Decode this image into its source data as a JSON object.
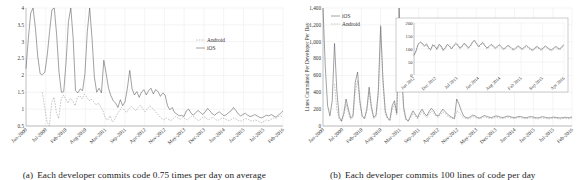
{
  "figure": {
    "panels": [
      {
        "id": "panel-a",
        "caption_label": "(a)",
        "caption_text": "Each developer commits code 0.75 times per day on average"
      },
      {
        "id": "panel-b",
        "caption_label": "(b)",
        "caption_text": "Each developer commits 100 lines of code per day"
      }
    ]
  },
  "colors": {
    "ios_line": "#555555",
    "android_line": "#8a8a8a",
    "grid": "#e2e2e2",
    "axis": "#8c8c8c",
    "text": "#2f2f2f",
    "background": "#ffffff"
  },
  "chart_data": [
    {
      "id": "commits-per-developer-per-day",
      "type": "line",
      "title": "",
      "xlabel": "",
      "ylabel": "",
      "ylim": [
        0.5,
        4
      ],
      "yticks": [
        "0.5",
        "1",
        "1.5",
        "2",
        "2.5",
        "3",
        "3.5",
        "4"
      ],
      "ytickvalues": [
        0.5,
        1,
        1.5,
        2,
        2.5,
        3,
        3.5,
        4
      ],
      "grid": true,
      "legend_position": "upper-right",
      "xtick_labels": [
        "Jan-2009",
        "Jul-2009",
        "Feb-2010",
        "Aug-2010",
        "Mar-2011",
        "Sep-2011",
        "Apr-2012",
        "Nov-2012",
        "May-2013",
        "Dec-2013",
        "Jun-2014",
        "Jan-2015",
        "Jul-2015",
        "Feb-2016"
      ],
      "series": [
        {
          "name": "Android",
          "style": "dashed",
          "values": [
            null,
            null,
            null,
            null,
            null,
            null,
            null,
            1.5,
            1.05,
            0.62,
            0.5,
            1.2,
            1.35,
            0.9,
            0.72,
            1.28,
            1.42,
            1.3,
            1.18,
            1.32,
            1.24,
            1.1,
            1.35,
            1.4,
            1.3,
            1.44,
            1.36,
            1.25,
            1.3,
            1.22,
            1.12,
            1.18,
            1.05,
            0.95,
            0.72,
            0.68,
            0.8,
            0.62,
            0.7,
            0.85,
            0.95,
            1.05,
            0.98,
            0.9,
            1.0,
            1.08,
            1.02,
            0.95,
            1.05,
            1.12,
            1.0,
            0.92,
            1.02,
            1.1,
            1.04,
            0.96,
            0.88,
            0.8,
            0.72,
            0.68,
            0.74,
            0.7,
            0.66,
            0.72,
            0.78,
            0.74,
            0.7,
            0.76,
            0.72,
            0.68,
            0.74,
            0.8,
            0.76,
            0.7,
            0.66,
            0.72,
            0.78,
            0.74,
            0.68,
            0.72,
            0.76,
            0.7,
            0.66,
            0.7,
            0.74,
            0.72,
            0.68,
            0.66,
            0.7,
            0.74,
            0.7,
            0.66,
            0.64,
            0.68,
            0.72,
            0.7,
            0.66,
            0.64,
            0.68,
            0.66,
            0.62,
            0.6,
            0.64,
            0.68,
            0.66,
            0.7,
            0.74,
            0.72,
            0.78,
            0.8,
            0.76
          ]
        },
        {
          "name": "iOS",
          "style": "solid",
          "values": [
            2.2,
            3.1,
            3.85,
            4.0,
            3.4,
            2.55,
            2.05,
            2.02,
            2.1,
            2.6,
            3.3,
            3.95,
            4.0,
            3.2,
            2.1,
            1.5,
            1.52,
            2.4,
            3.6,
            4.0,
            3.1,
            1.55,
            1.48,
            1.6,
            1.55,
            2.05,
            3.3,
            4.0,
            3.1,
            1.95,
            1.5,
            1.62,
            1.48,
            2.45,
            2.05,
            1.62,
            1.4,
            1.25,
            1.18,
            1.05,
            1.28,
            1.1,
            1.22,
            1.62,
            2.15,
            1.6,
            1.42,
            1.52,
            1.35,
            1.5,
            1.58,
            1.42,
            1.55,
            1.62,
            1.45,
            1.58,
            1.52,
            1.38,
            1.48,
            1.42,
            1.1,
            0.98,
            1.05,
            0.9,
            0.85,
            0.8,
            0.82,
            0.78,
            0.95,
            1.0,
            0.88,
            0.82,
            0.9,
            0.96,
            0.9,
            0.84,
            0.92,
            1.02,
            0.95,
            0.86,
            0.82,
            0.88,
            0.92,
            0.86,
            0.8,
            0.84,
            0.9,
            0.95,
            1.05,
            0.96,
            0.86,
            0.8,
            0.84,
            0.88,
            0.82,
            0.78,
            0.8,
            0.84,
            0.8,
            0.76,
            0.74,
            0.78,
            0.82,
            0.8,
            0.84,
            0.8,
            0.76,
            0.82,
            0.88,
            0.95
          ]
        }
      ]
    },
    {
      "id": "lines-committed-per-developer-per-day",
      "type": "line",
      "title": "",
      "xlabel": "",
      "ylabel": "Lines Committed Per Developer Per Day",
      "ylim": [
        0,
        1400
      ],
      "yticks": [
        "0",
        "200",
        "400",
        "600",
        "800",
        "1,000",
        "1,200",
        "1,400"
      ],
      "ytickvalues": [
        0,
        200,
        400,
        600,
        800,
        1000,
        1200,
        1400
      ],
      "grid": true,
      "legend_position": "upper-left",
      "xtick_labels": [
        "Jan-2009",
        "Jul-2009",
        "Feb-2010",
        "Aug-2010",
        "Mar-2011",
        "Sep-2011",
        "Apr-2012",
        "Nov-2012",
        "May-2013",
        "Dec-2013",
        "Jun-2014",
        "Jan-2015",
        "Jul-2015",
        "Feb-2016"
      ],
      "series": [
        {
          "name": "iOS",
          "style": "solid",
          "values": [
            1400,
            700,
            240,
            120,
            300,
            980,
            420,
            110,
            60,
            150,
            320,
            200,
            95,
            120,
            520,
            640,
            300,
            120,
            90,
            200,
            460,
            230,
            100,
            130,
            420,
            1180,
            560,
            180,
            95,
            70,
            240,
            300,
            150,
            1400,
            700,
            220,
            80,
            60,
            120,
            180,
            140,
            100,
            160,
            200,
            150,
            120,
            170,
            210,
            180,
            130,
            120,
            160,
            200,
            170,
            140,
            120,
            100,
            90,
            320,
            260,
            180,
            120,
            100,
            95,
            110,
            130,
            120,
            100,
            95,
            110,
            125,
            115,
            105,
            100,
            110,
            120,
            115,
            105,
            100,
            108,
            118,
            112,
            104,
            100,
            106,
            114,
            110,
            102,
            98,
            104,
            112,
            108,
            100,
            96,
            102,
            110,
            106,
            100,
            96,
            100,
            106,
            102,
            98,
            96,
            100,
            104,
            100,
            98,
            110
          ]
        },
        {
          "name": "Android",
          "style": "dashed",
          "values": [
            null,
            null,
            null,
            null,
            null,
            500,
            200,
            80,
            50,
            120,
            260,
            160,
            80,
            100,
            400,
            540,
            260,
            110,
            80,
            170,
            400,
            200,
            90,
            110,
            360,
            1200,
            480,
            150,
            85,
            60,
            200,
            260,
            130,
            1150,
            600,
            180,
            70,
            55,
            100,
            150,
            120,
            85,
            130,
            170,
            130,
            100,
            140,
            180,
            150,
            115,
            105,
            135,
            170,
            145,
            120,
            105,
            90,
            80,
            180,
            160,
            130,
            100,
            90,
            85,
            95,
            110,
            105,
            90,
            85,
            95,
            108,
            100,
            92,
            88,
            95,
            105,
            100,
            92,
            88,
            94,
            104,
            98,
            92,
            88,
            94,
            100,
            96,
            90,
            86,
            92,
            98,
            94,
            88,
            84,
            90,
            96,
            92,
            88,
            84,
            88,
            94,
            90,
            86,
            84,
            88,
            92,
            88,
            86,
            98
          ]
        }
      ],
      "inset": {
        "id": "inset-zoom",
        "type": "line",
        "ylim": [
          0,
          200
        ],
        "yticks": [
          "0",
          "50",
          "100",
          "150",
          "200"
        ],
        "ytickvalues": [
          0,
          50,
          100,
          150,
          200
        ],
        "xtick_labels": [
          "Jun 2012",
          "Dec 2012",
          "Jul 2013",
          "Jan 2014",
          "Aug 2014",
          "Feb 2015",
          "Sep 2015",
          "Apr 2016"
        ],
        "series": [
          {
            "name": "iOS",
            "style": "solid",
            "values": [
              75,
              92,
              118,
              126,
              122,
              112,
              120,
              105,
              98,
              115,
              110,
              100,
              118,
              112,
              96,
              105,
              118,
              110,
              100,
              112,
              120,
              115,
              104,
              110,
              122,
              116,
              105,
              112,
              126,
              132,
              120,
              110,
              118,
              124,
              112,
              104,
              110,
              118,
              112,
              104,
              110,
              116,
              108,
              100,
              106,
              114,
              110,
              102,
              98,
              106,
              112,
              106,
              100,
              108,
              114,
              106,
              100,
              96,
              104,
              110,
              104,
              98,
              104,
              112,
              106,
              100,
              96,
              104,
              110,
              104,
              100,
              110,
              116
            ]
          },
          {
            "name": "Android",
            "style": "dashed",
            "values": [
              78,
              96,
              120,
              128,
              118,
              108,
              116,
              100,
              95,
              118,
              114,
              96,
              112,
              108,
              92,
              100,
              112,
              116,
              104,
              108,
              124,
              118,
              100,
              106,
              118,
              112,
              100,
              108,
              122,
              136,
              124,
              106,
              114,
              128,
              116,
              100,
              106,
              114,
              108,
              100,
              106,
              112,
              104,
              96,
              102,
              110,
              106,
              98,
              94,
              102,
              108,
              102,
              96,
              104,
              110,
              102,
              96,
              92,
              100,
              106,
              100,
              94,
              100,
              108,
              102,
              96,
              92,
              100,
              106,
              100,
              96,
              106,
              112
            ]
          }
        ]
      }
    }
  ]
}
